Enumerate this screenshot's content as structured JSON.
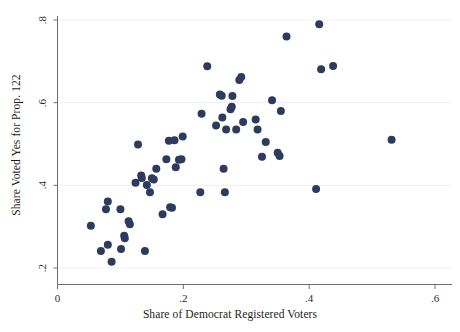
{
  "chart_data": {
    "type": "scatter",
    "title": "",
    "xlabel": "Share of Democrat Registered Voters",
    "ylabel": "Share Voted Yes for Prop. 122",
    "xlim": [
      0,
      0.6
    ],
    "ylim": [
      0.2,
      0.8
    ],
    "xticks": [
      0,
      0.2,
      0.4,
      0.6
    ],
    "xticklabels": [
      "0",
      ".2",
      ".4",
      ".6"
    ],
    "yticks": [
      0.2,
      0.4,
      0.6,
      0.8
    ],
    "yticklabels": [
      ".2",
      ".4",
      ".6",
      ".8"
    ],
    "grid": "horizontal-faint",
    "legend": "none",
    "marker": {
      "shape": "circle",
      "size": 5.2,
      "color": "#2d3c5e"
    },
    "points": [
      {
        "x": 0.053,
        "y": 0.302
      },
      {
        "x": 0.069,
        "y": 0.241
      },
      {
        "x": 0.077,
        "y": 0.342
      },
      {
        "x": 0.08,
        "y": 0.361
      },
      {
        "x": 0.08,
        "y": 0.256
      },
      {
        "x": 0.086,
        "y": 0.215
      },
      {
        "x": 0.1,
        "y": 0.342
      },
      {
        "x": 0.101,
        "y": 0.246
      },
      {
        "x": 0.106,
        "y": 0.278
      },
      {
        "x": 0.107,
        "y": 0.272
      },
      {
        "x": 0.113,
        "y": 0.313
      },
      {
        "x": 0.115,
        "y": 0.306
      },
      {
        "x": 0.124,
        "y": 0.406
      },
      {
        "x": 0.128,
        "y": 0.499
      },
      {
        "x": 0.133,
        "y": 0.424
      },
      {
        "x": 0.134,
        "y": 0.418
      },
      {
        "x": 0.139,
        "y": 0.241
      },
      {
        "x": 0.142,
        "y": 0.401
      },
      {
        "x": 0.147,
        "y": 0.383
      },
      {
        "x": 0.15,
        "y": 0.417
      },
      {
        "x": 0.153,
        "y": 0.414
      },
      {
        "x": 0.157,
        "y": 0.44
      },
      {
        "x": 0.167,
        "y": 0.33
      },
      {
        "x": 0.173,
        "y": 0.463
      },
      {
        "x": 0.177,
        "y": 0.508
      },
      {
        "x": 0.179,
        "y": 0.347
      },
      {
        "x": 0.182,
        "y": 0.346
      },
      {
        "x": 0.186,
        "y": 0.509
      },
      {
        "x": 0.188,
        "y": 0.444
      },
      {
        "x": 0.193,
        "y": 0.462
      },
      {
        "x": 0.197,
        "y": 0.463
      },
      {
        "x": 0.199,
        "y": 0.518
      },
      {
        "x": 0.227,
        "y": 0.383
      },
      {
        "x": 0.229,
        "y": 0.573
      },
      {
        "x": 0.238,
        "y": 0.688
      },
      {
        "x": 0.252,
        "y": 0.545
      },
      {
        "x": 0.258,
        "y": 0.62
      },
      {
        "x": 0.261,
        "y": 0.617
      },
      {
        "x": 0.262,
        "y": 0.564
      },
      {
        "x": 0.264,
        "y": 0.44
      },
      {
        "x": 0.266,
        "y": 0.383
      },
      {
        "x": 0.268,
        "y": 0.535
      },
      {
        "x": 0.275,
        "y": 0.584
      },
      {
        "x": 0.277,
        "y": 0.59
      },
      {
        "x": 0.278,
        "y": 0.616
      },
      {
        "x": 0.284,
        "y": 0.535
      },
      {
        "x": 0.289,
        "y": 0.655
      },
      {
        "x": 0.292,
        "y": 0.662
      },
      {
        "x": 0.295,
        "y": 0.553
      },
      {
        "x": 0.315,
        "y": 0.559
      },
      {
        "x": 0.318,
        "y": 0.535
      },
      {
        "x": 0.325,
        "y": 0.469
      },
      {
        "x": 0.331,
        "y": 0.505
      },
      {
        "x": 0.341,
        "y": 0.606
      },
      {
        "x": 0.35,
        "y": 0.479
      },
      {
        "x": 0.353,
        "y": 0.471
      },
      {
        "x": 0.355,
        "y": 0.58
      },
      {
        "x": 0.364,
        "y": 0.76
      },
      {
        "x": 0.411,
        "y": 0.391
      },
      {
        "x": 0.416,
        "y": 0.79
      },
      {
        "x": 0.419,
        "y": 0.681
      },
      {
        "x": 0.438,
        "y": 0.689
      },
      {
        "x": 0.531,
        "y": 0.51
      }
    ]
  },
  "axes": {
    "x_title": "Share of Democrat Registered Voters",
    "y_title": "Share Voted Yes for Prop. 122",
    "x_tick_labels": [
      "0",
      ".2",
      ".4",
      ".6"
    ],
    "y_tick_labels": [
      ".2",
      ".4",
      ".6",
      ".8"
    ]
  },
  "colors": {
    "marker": "#2d3c5e",
    "axis": "#6e6e6e",
    "gridline": "#eef0f4",
    "text": "#1c1c1c",
    "background": "#ffffff"
  }
}
